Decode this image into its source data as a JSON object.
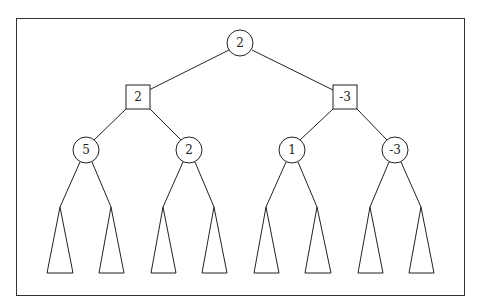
{
  "diagram": {
    "type": "game-tree",
    "root": {
      "shape": "circle",
      "value": "2"
    },
    "level1": [
      {
        "shape": "square",
        "value": "2"
      },
      {
        "shape": "square",
        "value": "-3"
      }
    ],
    "level2": [
      {
        "shape": "circle",
        "value": "5"
      },
      {
        "shape": "circle",
        "value": "2"
      },
      {
        "shape": "circle",
        "value": "1"
      },
      {
        "shape": "circle",
        "value": "-3"
      }
    ],
    "subtrees": 8
  }
}
